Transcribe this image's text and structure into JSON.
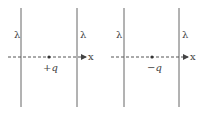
{
  "panels": [
    {
      "id": "left",
      "wire_label_left": "λ",
      "wire_label_right": "λ",
      "charge_label": "+q",
      "axis_label": "x"
    },
    {
      "id": "right",
      "wire_label_left": "λ",
      "wire_label_right": "λ",
      "charge_label": "−q",
      "axis_label": "x"
    }
  ],
  "colors": {
    "line": "#666666",
    "text": "#444444"
  }
}
